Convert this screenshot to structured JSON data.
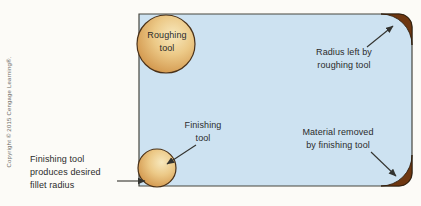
{
  "figure": {
    "copyright": "Copyright © 2015 Cengage Learning®.",
    "labels": {
      "roughing_tool": "Roughing\ntool",
      "radius_left": "Radius left by\nroughing tool",
      "finishing_tool": "Finishing\ntool",
      "material_removed": "Material removed\nby finishing tool",
      "fillet_note": "Finishing tool\nproduces desired\nfillet radius"
    },
    "colors": {
      "part_fill": "#cde2f1",
      "part_outline": "#46463f",
      "removed_material": "#6e3711",
      "removed_edge": "#2e1c0a",
      "tool_outline": "#4a3118",
      "tool_light": "#f6e6b8",
      "tool_mid": "#e6bd74",
      "tool_dark": "#cf9045",
      "arrow": "#33332f",
      "text": "#2b2b2b"
    }
  }
}
